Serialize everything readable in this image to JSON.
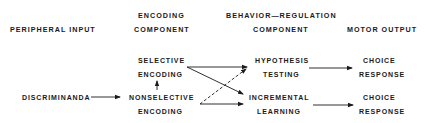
{
  "headers": {
    "peripheral_input": "PERIPHERAL INPUT",
    "encoding_line1": "ENCODING",
    "encoding_line2": "COMPONENT",
    "behavior_line1": "BEHAVIOR—REGULATION",
    "behavior_line2": "COMPONENT",
    "motor_output": "MOTOR OUTPUT"
  },
  "nodes": {
    "discriminanda": "DISCRIMINANDA",
    "selective_line1": "SELECTIVE",
    "selective_line2": "ENCODING",
    "nonselective_line1": "NONSELECTIVE",
    "nonselective_line2": "ENCODING",
    "hypothesis_line1": "HYPOTHESIS",
    "hypothesis_line2": "TESTING",
    "incremental_line1": "INCREMENTAL",
    "incremental_line2": "LEARNING",
    "choice1_line1": "CHOICE",
    "choice1_line2": "RESPONSE",
    "choice2_line1": "CHOICE",
    "choice2_line2": "RESPONSE"
  },
  "edges": [
    {
      "from": "discriminanda",
      "to": "nonselective",
      "style": "solid"
    },
    {
      "from": "nonselective",
      "to": "selective",
      "style": "solid"
    },
    {
      "from": "selective",
      "to": "hypothesis",
      "style": "solid"
    },
    {
      "from": "selective",
      "to": "incremental",
      "style": "solid"
    },
    {
      "from": "nonselective",
      "to": "hypothesis",
      "style": "dashed"
    },
    {
      "from": "nonselective",
      "to": "incremental",
      "style": "solid"
    },
    {
      "from": "hypothesis",
      "to": "choice1",
      "style": "solid"
    },
    {
      "from": "incremental",
      "to": "choice2",
      "style": "solid"
    }
  ],
  "colors": {
    "ink": "#1a1a1a",
    "background": "#ffffff"
  }
}
